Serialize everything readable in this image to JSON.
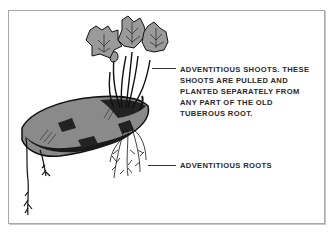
{
  "diagram": {
    "labels": {
      "shoots": {
        "lines": [
          "ADVENTITIOUS SHOOTS. THESE",
          "SHOOTS ARE PULLED AND",
          "PLANTED SEPARATELY FROM",
          "ANY PART OF THE OLD",
          "TUBEROUS ROOT."
        ]
      },
      "roots": {
        "text": "ADVENTITIOUS ROOTS"
      }
    },
    "colors": {
      "frame_border": "#a8a8a8",
      "ink": "#1a1a1a",
      "tuber_fill": "#8a8a8a",
      "leaf_fill": "#9a9a9a",
      "text": "#2a2a2a"
    }
  }
}
